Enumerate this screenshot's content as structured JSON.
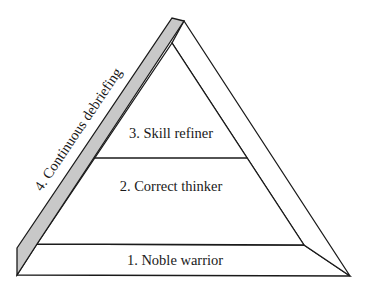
{
  "diagram": {
    "type": "pyramid",
    "levels": [
      {
        "label": "1. Noble warrior"
      },
      {
        "label": "2. Correct thinker"
      },
      {
        "label": "3. Skill refiner"
      }
    ],
    "side_band": {
      "label": "4. Continuous debriefing",
      "color": "#c8c8c8"
    },
    "colors": {
      "line": "#1a1a1a",
      "fill": "#ffffff",
      "band": "#c8c8c8"
    }
  }
}
